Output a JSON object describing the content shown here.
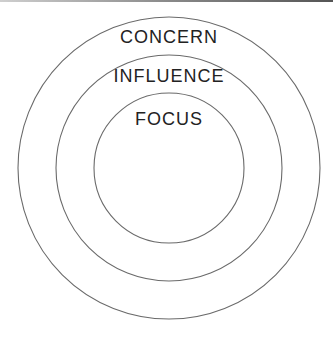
{
  "diagram": {
    "type": "concentric-circles",
    "circles": [
      {
        "label": "CONCERN",
        "cx": 169,
        "cy": 168,
        "r": 151
      },
      {
        "label": "INFLUENCE",
        "cx": 169,
        "cy": 168,
        "r": 113
      },
      {
        "label": "FOCUS",
        "cx": 169,
        "cy": 168,
        "r": 75
      }
    ],
    "stroke_color": "#666666"
  }
}
